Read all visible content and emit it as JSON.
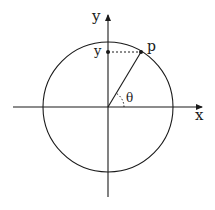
{
  "diagram": {
    "labels": {
      "y_axis": "y",
      "x_axis": "x",
      "point": "p",
      "y_projection": "y",
      "angle": "θ"
    },
    "colors": {
      "stroke": "#1a1a1a",
      "background": "#ffffff"
    },
    "geometry": {
      "origin": [
        108,
        107
      ],
      "radius": 65,
      "point_p": [
        141,
        52
      ],
      "point_y": [
        108,
        52
      ]
    }
  }
}
